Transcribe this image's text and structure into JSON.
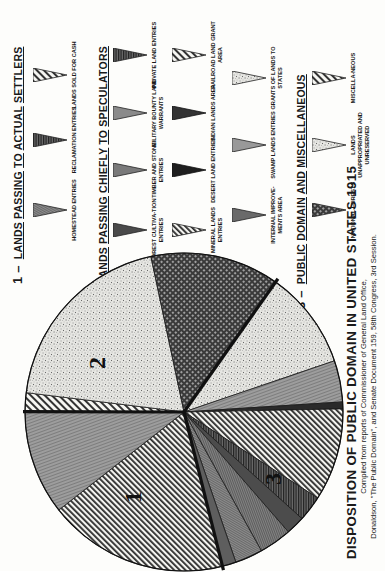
{
  "chart_data": {
    "type": "pie",
    "title": "DISPOSITION OF PUBLIC DOMAIN IN UNITED STATES 1915",
    "subtitle": "Compiled from reports of Commissioner of General Land Office, Donaldson, \"The Public Domain\", and Senate Document 159, 58th Congress, 3rd Session.",
    "orientation": "page rotated 90 degrees counter-clockwise",
    "group_labels_on_chart": [
      "1",
      "2",
      "3"
    ],
    "groups": [
      {
        "id": "1",
        "name": "LANDS PASSING TO ACTUAL SETTLERS",
        "approx_percent": 29
      },
      {
        "id": "2",
        "name": "LANDS PASSING CHIEFLY TO SPECULATORS",
        "approx_percent": 36
      },
      {
        "id": "3",
        "name": "PUBLIC DOMAIN AND MISCELLANEOUS",
        "approx_percent": 35
      }
    ],
    "slices": [
      {
        "group": "1",
        "label": "Homestead Entries",
        "pattern": "diagonal-hatch",
        "approx_percent": 18.3
      },
      {
        "group": "1",
        "label": "Reclamation Entries / Lands Sold for Cash",
        "pattern": "fine-gray",
        "approx_percent": 10.6
      },
      {
        "group": "3",
        "label": "Miscellaneous",
        "pattern": "diagonal-hatch-light",
        "approx_percent": 1.9
      },
      {
        "group": "3",
        "label": "Lands Unappropriated and Unreserved",
        "pattern": "stipple",
        "approx_percent": 19.7
      },
      {
        "group": "3",
        "label": "National Forests",
        "pattern": "crosshatch-dots",
        "approx_percent": 13.1
      },
      {
        "group": "2",
        "label": "Swamp Lands Entries / Grants of Lands to States",
        "pattern": "stipple",
        "approx_percent": 10.0
      },
      {
        "group": "2",
        "label": "Indian Lands Area",
        "pattern": "gray",
        "approx_percent": 4.2
      },
      {
        "group": "2",
        "label": "Desert Land Entries",
        "pattern": "dark",
        "approx_percent": 0.7
      },
      {
        "group": "2",
        "label": "Railroad Land Grant Area",
        "pattern": "diagonal-hatch",
        "approx_percent": 9.4
      },
      {
        "group": "2",
        "label": "Private Land Entries",
        "pattern": "dark-lines",
        "approx_percent": 2.6
      },
      {
        "group": "2",
        "label": "Military Bounty Land Warrants",
        "pattern": "dark-gray",
        "approx_percent": 1.9
      },
      {
        "group": "2",
        "label": "Timber and Stone Entries",
        "pattern": "mid-gray",
        "approx_percent": 3.3
      },
      {
        "group": "2",
        "label": "Internal Improvements Area",
        "pattern": "gray-lines",
        "approx_percent": 2.8
      },
      {
        "group": "2",
        "label": "Mineral Lands Entries / Forest Culture Entries",
        "pattern": "gray-dark",
        "approx_percent": 1.4
      }
    ],
    "legend_position": "top"
  },
  "title": {
    "main": "DISPOSITION OF PUBLIC DOMAIN IN UNITED STATES 1915",
    "line1": "Compiled from reports of Commissioner of General Land Office,",
    "line2": "Donaldson, \"The Public Domain\", and Senate Document 159, 58th Congress, 3rd Session."
  },
  "pie_labels": {
    "g1": "1",
    "g2": "2",
    "g3": "3"
  },
  "legend": {
    "group1": {
      "num": "1 –",
      "words": [
        "LANDS",
        "PASSING",
        "TO",
        "ACTUAL",
        "SETTLERS"
      ],
      "items": [
        "HOMESTEAD ENTRIES",
        "RECLAMATION ENTRIES",
        "LANDS SOLD FOR CASH"
      ]
    },
    "group2": {
      "num": "2 –",
      "words": [
        "LANDS",
        "PASSING",
        "CHIEFLY",
        "TO",
        "SPECULATORS"
      ],
      "items": [
        "FOREST CULTIVA-TION ENTRIES",
        "TIMBER AND STONE ENTRIES",
        "MILITARY BOUNTY LAND WARRANTS",
        "PRIVATE LAND ENTRIES",
        "MINERAL LANDS ENTRIES",
        "DESERT LAND ENTRIES",
        "INDIAN LANDS AREA",
        "RAILROAD LAND GRANT AREA",
        "INTERNAL IMPROVE-MENTS AREA",
        "SWAMP LANDS ENTRIES",
        "GRANTS OF LANDS TO STATES"
      ]
    },
    "group3": {
      "num": "3 –",
      "words": [
        "PUBLIC",
        "DOMAIN",
        "AND",
        "MISCELLANEOUS"
      ],
      "items": [
        "NATIONAL FORESTS",
        "LANDS UNAPPROPRIATED AND UNRESERVED",
        "MISCELLA-NEOUS"
      ]
    }
  }
}
